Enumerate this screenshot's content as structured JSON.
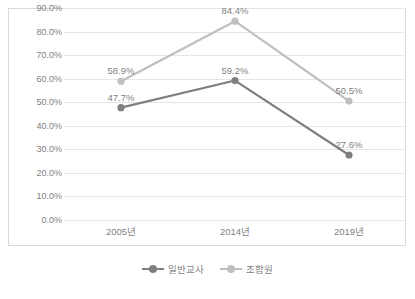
{
  "chart_data": {
    "type": "line",
    "title": "",
    "subtitle": "",
    "xlabel": "",
    "ylabel": "",
    "categories": [
      "2005년",
      "2014년",
      "2019년"
    ],
    "ylim": [
      0,
      90
    ],
    "ytick_step": 10,
    "ytick_labels": [
      "0.0%",
      "10.0%",
      "20.0%",
      "30.0%",
      "40.0%",
      "50.0%",
      "60.0%",
      "70.0%",
      "80.0%",
      "90.0%"
    ],
    "grid": true,
    "legend_position": "bottom",
    "series": [
      {
        "name": "일반교사",
        "color": "#7f7f7f",
        "values": [
          47.7,
          59.2,
          27.6
        ],
        "labels": [
          "47.7%",
          "59.2%",
          "27.6%"
        ]
      },
      {
        "name": "조합원",
        "color": "#bfbfbf",
        "values": [
          58.9,
          84.4,
          50.5
        ],
        "labels": [
          "58.9%",
          "84.4%",
          "50.5%"
        ]
      }
    ]
  },
  "legend": {
    "items": [
      {
        "label": "일반교사",
        "color": "#7f7f7f"
      },
      {
        "label": "조합원",
        "color": "#bfbfbf"
      }
    ]
  },
  "colors": {
    "series_teacher": "#7f7f7f",
    "series_member": "#bfbfbf",
    "grid": "#e6e6e6",
    "frame": "#d9d9d9",
    "text": "#7f7f7f",
    "background": "#ffffff"
  }
}
